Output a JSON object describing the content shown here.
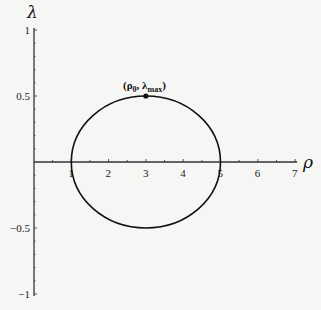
{
  "chart_data": {
    "type": "line",
    "title": "",
    "xlabel": "ρ",
    "ylabel": "λ",
    "xlim": [
      0,
      7
    ],
    "ylim": [
      -1,
      1
    ],
    "x_ticks": [
      1,
      2,
      3,
      4,
      5,
      6,
      7
    ],
    "y_ticks": [
      1,
      0.5,
      -0.5,
      -1
    ],
    "x_tick_labels": [
      "1",
      "2",
      "3",
      "4",
      "5",
      "6",
      "7"
    ],
    "y_tick_labels": [
      "1",
      "0.5",
      "−0.5",
      "−1"
    ],
    "grid": false,
    "legend": null,
    "series": [
      {
        "name": "closed curve",
        "shape": "ellipse",
        "center": [
          3,
          0
        ],
        "semi_axis_rho": 2,
        "semi_axis_lambda": 0.5,
        "points": [
          [
            1,
            0
          ],
          [
            1.27,
            0.25
          ],
          [
            2,
            0.433
          ],
          [
            3,
            0.5
          ],
          [
            4,
            0.433
          ],
          [
            4.73,
            0.25
          ],
          [
            5,
            0
          ],
          [
            4.73,
            -0.25
          ],
          [
            4,
            -0.433
          ],
          [
            3,
            -0.5
          ],
          [
            2,
            -0.433
          ],
          [
            1.27,
            -0.25
          ],
          [
            1,
            0
          ]
        ]
      }
    ],
    "annotations": [
      {
        "point": [
          3,
          0.5
        ],
        "label": "(ρ₀, λmax)",
        "marker": "filled-circle"
      }
    ]
  },
  "labels": {
    "y_axis_title": "λ",
    "x_axis_title": "ρ",
    "annotation_main": "(ρ",
    "annotation_sub0": "0",
    "annotation_mid": ", λ",
    "annotation_submax": "max",
    "annotation_end": ")"
  }
}
